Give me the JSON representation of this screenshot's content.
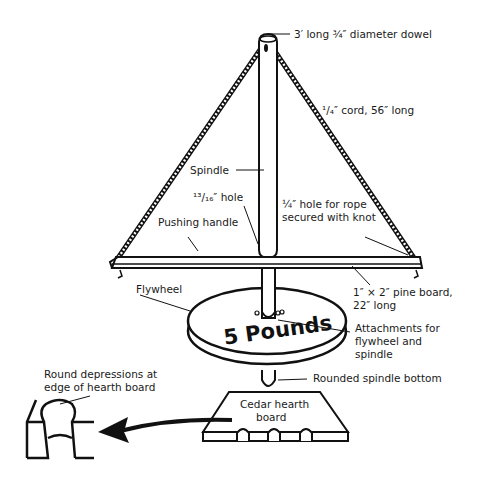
{
  "labels": {
    "dowel": "3′ long ¾″ diameter dowel",
    "cord": "¹/₄″ cord, 56″ long",
    "spindle": "Spindle",
    "hole_13_16": "¹³/₁₆″ hole",
    "pushing_handle": "Pushing handle",
    "rope_hole_line1": "¼″ hole for rope",
    "rope_hole_line2": "secured with knot",
    "flywheel": "Flywheel",
    "pine_board_line1": "1″ × 2″ pine board,",
    "pine_board_line2": "22″ long",
    "attachments_line1": "Attachments for",
    "attachments_line2": "flywheel and",
    "attachments_line3": "spindle",
    "weight": "5 Pounds",
    "rounded_bottom": "Rounded spindle bottom",
    "hearth_line1": "Cedar hearth",
    "hearth_line2": "board",
    "depressions_line1": "Round depressions at",
    "depressions_line2": "edge of hearth board"
  },
  "colors": {
    "line": "#111111",
    "background": "#ffffff"
  }
}
